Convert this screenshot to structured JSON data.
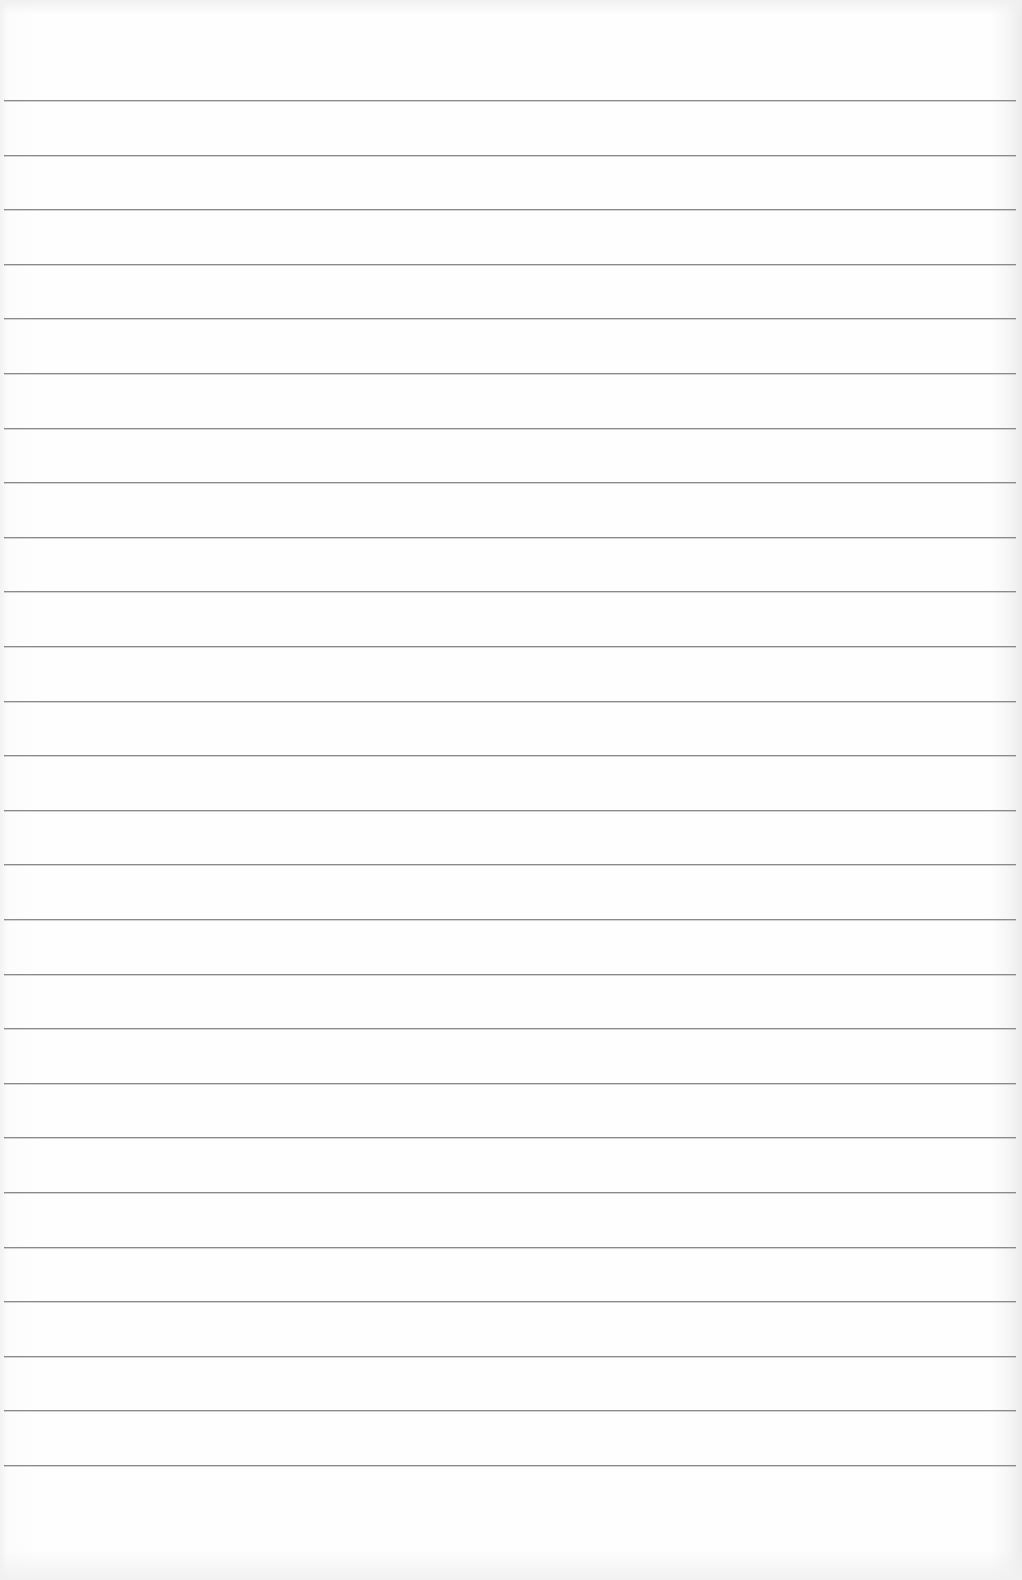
{
  "page": {
    "type": "blank ruled notebook paper",
    "line_count": 26,
    "first_line_y": 100,
    "line_spacing": 54.6,
    "line_color": "#8a8a8a",
    "paper_color": "#fdfdfd",
    "text_content": ""
  }
}
